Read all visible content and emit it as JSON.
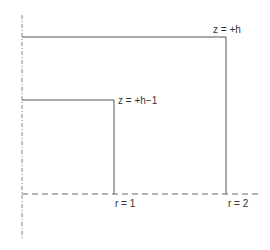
{
  "diagram": {
    "colors": {
      "line": "#555555",
      "axis": "#888888",
      "text": "#333333",
      "background": "#ffffff"
    },
    "labels": {
      "outer_top": "z = +h",
      "inner_top": "z = +h−1",
      "r1": "r = 1",
      "r2": "r = 2"
    },
    "elements": {
      "axis": {
        "x": 22,
        "y1": 15,
        "y2": 240,
        "style": "dash-dot"
      },
      "baseline": {
        "y": 194,
        "x1": 22,
        "x2": 258,
        "style": "dashed"
      },
      "outer_rect": {
        "x": 22,
        "top": 37,
        "right": 226,
        "bottom": 194
      },
      "inner_rect": {
        "x": 22,
        "top": 100,
        "right": 114,
        "bottom": 194
      }
    }
  }
}
